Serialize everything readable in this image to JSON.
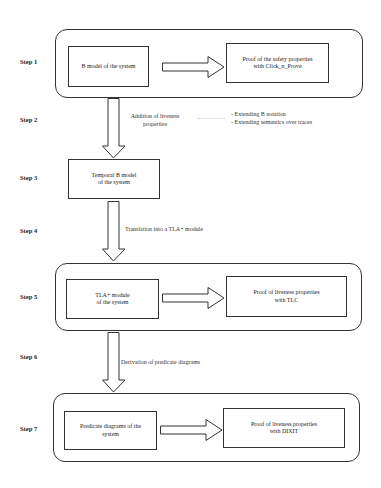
{
  "steps": [
    {
      "label": "Step 1"
    },
    {
      "label": "Step 2"
    },
    {
      "label": "Step 3"
    },
    {
      "label": "Step 4"
    },
    {
      "label": "Step 5"
    },
    {
      "label": "Step 6"
    },
    {
      "label": "Step 7"
    }
  ],
  "step1": {
    "model_box": "B model  of the system",
    "proof_box_line1": "Proof of the  safety properties",
    "proof_box_line2": "with Click_n_Prove"
  },
  "step2": {
    "arrow_label_line1": "Addition of liveness",
    "arrow_label_line2": "properties",
    "notes": [
      "- Extending B notation",
      "- Extending semantics over traces"
    ]
  },
  "step3": {
    "model_box_line1": "Temporal B model",
    "model_box_line2": "of the system"
  },
  "step4": {
    "arrow_label": "Translation into a TLA+ module"
  },
  "step5": {
    "model_box_line1": "TLA+ module",
    "model_box_line2": "of the system",
    "proof_box_line1": "Proof of liveness properties",
    "proof_box_line2": "with TLC"
  },
  "step6": {
    "arrow_label": "Derivation of predicate diagrams"
  },
  "step7": {
    "model_box_line1": "Predicate diagrams of the",
    "model_box_line2": "system",
    "proof_box_line1": "Proof of liveness properties",
    "proof_box_line2": "with DIXIT"
  },
  "colors": {
    "stroke": "#333333",
    "background": "#ffffff",
    "connector": "#dddddd"
  }
}
